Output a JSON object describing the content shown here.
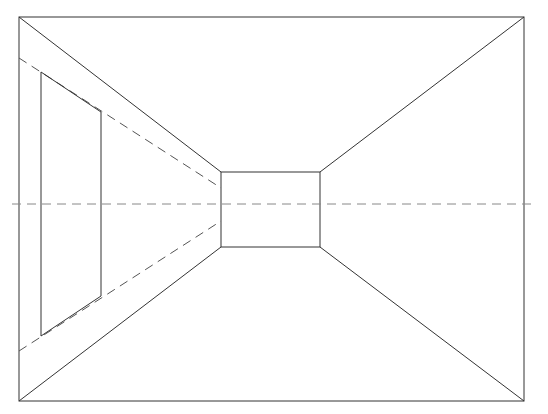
{
  "diagram": {
    "type": "one-point-perspective-room",
    "width": 548,
    "height": 414,
    "stroke_color": "#333333",
    "dash_color": "#555555",
    "outer_frame": {
      "x1": 19,
      "y1": 17,
      "x2": 524,
      "y2": 401
    },
    "back_wall": {
      "x1": 221,
      "y1": 172,
      "x2": 320,
      "y2": 247
    },
    "horizon": {
      "y": 204,
      "x_start": 12,
      "x_end": 536
    },
    "window": {
      "top_left": [
        41,
        72
      ],
      "top_right": [
        101,
        112
      ],
      "bottom_right": [
        101,
        296
      ],
      "bottom_left": [
        41,
        336
      ]
    },
    "guide_lines": {
      "upper": {
        "from": [
          19,
          58
        ],
        "to": [
          221,
          188
        ]
      },
      "lower": {
        "from": [
          19,
          351
        ],
        "to": [
          221,
          221
        ]
      }
    }
  }
}
